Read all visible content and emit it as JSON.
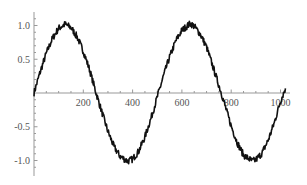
{
  "chart_data": {
    "type": "line",
    "title": "",
    "xlabel": "",
    "ylabel": "",
    "xlim": [
      0,
      1030
    ],
    "ylim": [
      -1.2,
      1.2
    ],
    "grid": false,
    "legend": null,
    "x_ticks": [
      200,
      400,
      600,
      800,
      1000
    ],
    "x_tick_labels": [
      "200",
      "400",
      "600",
      "800",
      "1000"
    ],
    "y_ticks": [
      1.0,
      0.5,
      -0.5,
      -1.0
    ],
    "y_tick_labels": [
      "1.0",
      "0.5",
      "-0.5",
      "-1.0"
    ],
    "series": [
      {
        "name": "noisy sine",
        "description": "sin(2*pi*x/505) with small random noise (~±0.05)",
        "color": "#111111",
        "x": [
          0,
          25,
          50,
          75,
          100,
          126,
          150,
          175,
          200,
          225,
          252,
          275,
          300,
          325,
          350,
          380,
          400,
          425,
          450,
          475,
          505,
          525,
          550,
          575,
          600,
          634,
          650,
          675,
          700,
          725,
          760,
          775,
          800,
          825,
          850,
          886,
          900,
          925,
          950,
          975,
          1000,
          1020
        ],
        "y": [
          0.0,
          0.31,
          0.59,
          0.81,
          0.96,
          1.02,
          0.97,
          0.83,
          0.62,
          0.35,
          0.0,
          -0.28,
          -0.57,
          -0.8,
          -0.94,
          -1.01,
          -0.98,
          -0.86,
          -0.65,
          -0.37,
          0.0,
          0.25,
          0.53,
          0.77,
          0.93,
          1.03,
          0.99,
          0.87,
          0.68,
          0.4,
          0.0,
          -0.19,
          -0.49,
          -0.74,
          -0.92,
          -1.01,
          -0.99,
          -0.89,
          -0.7,
          -0.44,
          -0.12,
          0.07
        ]
      }
    ]
  }
}
